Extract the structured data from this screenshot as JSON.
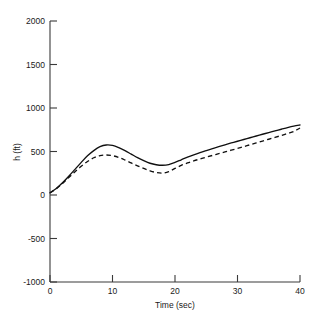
{
  "chart_data": {
    "type": "line",
    "title": "",
    "subtitle": "",
    "xlabel": "Time (sec)",
    "ylabel": "h (ft)",
    "xlim": [
      0,
      40
    ],
    "ylim": [
      -1000,
      2000
    ],
    "xticks": [
      0,
      10,
      20,
      30,
      40
    ],
    "yticks": [
      -1000,
      -500,
      0,
      500,
      1000,
      1500,
      2000
    ],
    "xtick_labels": [
      "0",
      "10",
      "20",
      "30",
      "40"
    ],
    "ytick_labels": [
      "-1000",
      "-500",
      "0",
      "500",
      "1000",
      "1500",
      "2000"
    ],
    "grid": false,
    "legend": null,
    "legend_position": "none",
    "annotations": [],
    "x": [
      0,
      1,
      2,
      3,
      4,
      5,
      6,
      7,
      8,
      9,
      10,
      11,
      12,
      13,
      14,
      15,
      16,
      17,
      18,
      19,
      20,
      21,
      22,
      23,
      24,
      25,
      26,
      27,
      28,
      29,
      30,
      31,
      32,
      33,
      34,
      35,
      36,
      37,
      38,
      39,
      40
    ],
    "series": [
      {
        "name": "solid",
        "style": "solid",
        "color": "#101010",
        "values": [
          25,
          75,
          140,
          215,
          295,
          375,
          450,
          510,
          555,
          575,
          570,
          545,
          510,
          470,
          430,
          395,
          365,
          348,
          342,
          350,
          375,
          405,
          435,
          462,
          487,
          510,
          533,
          555,
          577,
          598,
          618,
          638,
          658,
          678,
          698,
          718,
          737,
          756,
          775,
          792,
          805
        ]
      },
      {
        "name": "dashed",
        "style": "dashed",
        "color": "#101010",
        "values": [
          25,
          72,
          132,
          200,
          268,
          330,
          385,
          428,
          453,
          460,
          452,
          432,
          402,
          368,
          335,
          305,
          278,
          258,
          252,
          268,
          305,
          340,
          368,
          392,
          414,
          435,
          455,
          475,
          495,
          515,
          535,
          556,
          577,
          598,
          620,
          641,
          662,
          684,
          707,
          730,
          770
        ]
      }
    ]
  }
}
